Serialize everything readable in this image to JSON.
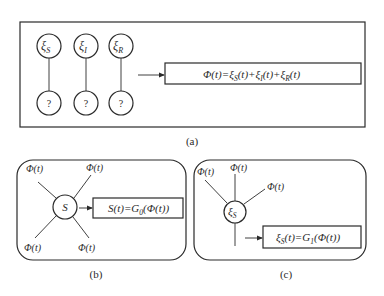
{
  "panel_a": {
    "label": "(a)",
    "nodes_top": [
      {
        "symbol": "ξ",
        "subscript": "S"
      },
      {
        "symbol": "ξ",
        "subscript": "I"
      },
      {
        "symbol": "ξ",
        "subscript": "R"
      }
    ],
    "nodes_bottom": [
      "?",
      "?",
      "?"
    ],
    "formula": "Φ(t)=ξS(t)+ξI(t)+ξR(t)",
    "formula_parts": {
      "lhs": "Φ(t)=",
      "t1": "ξ",
      "t1_sub": "S",
      "t1_arg": "(t)+",
      "t2": "ξ",
      "t2_sub": "I",
      "t2_arg": "(t)+",
      "t3": "ξ",
      "t3_sub": "R",
      "t3_arg": "(t)"
    }
  },
  "panel_b": {
    "label": "(b)",
    "center_node": "S",
    "spokes": [
      "Φ(t)",
      "Φ(t)",
      "Φ(t)",
      "Φ(t)"
    ],
    "formula": "S(t)=G0(Φ(t))",
    "formula_parts": {
      "pre": "S(t)=G",
      "sub": "0",
      "post": "(Φ(t))"
    }
  },
  "panel_c": {
    "label": "(c)",
    "center_node": {
      "symbol": "ξ",
      "subscript": "S"
    },
    "spokes": [
      "Φ(t)",
      "Φ(t)",
      "Φ(t)"
    ],
    "formula": "ξS(t)=G1(Φ(t))",
    "formula_parts": {
      "a": "ξ",
      "a_sub": "S",
      "mid": "(t)=G",
      "g_sub": "1",
      "post": "(Φ(t))"
    }
  },
  "colors": {
    "stroke": "#2a2a2a",
    "background": "#ffffff"
  }
}
